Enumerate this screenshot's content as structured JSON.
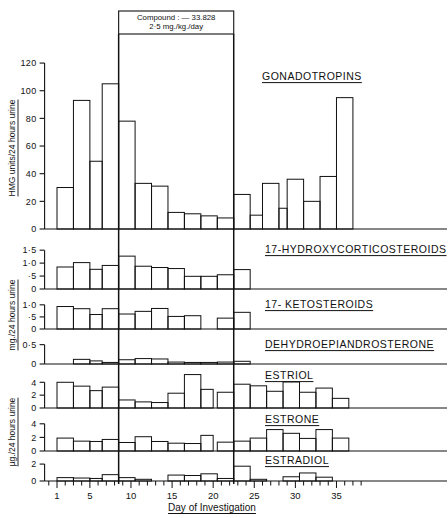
{
  "figure": {
    "treatment_header": {
      "line1": "Compound : — 33.828",
      "line2": "2·5 mg./kg./day",
      "start_day": 8.5,
      "end_day": 22.5
    },
    "x_axis": {
      "title": "Day of Investigation",
      "ticks": [
        1,
        5,
        10,
        15,
        20,
        25,
        30,
        35
      ],
      "min_day": 0,
      "max_day": 38,
      "minor_tick_every": 1
    },
    "axis_titles": {
      "gonadotropins": "HMG units/24 hours urine",
      "steroids_mg": "mg./24 hours urine",
      "estrogens_ug": "µg./24 hours urine"
    }
  },
  "chart_data": [
    {
      "type": "bar",
      "title": "GONADOTROPINS",
      "ylabel": "HMG units/24 hours urine",
      "xlabel": "Day of Investigation",
      "ylim": [
        0,
        128
      ],
      "yticks": [
        0,
        20,
        40,
        60,
        80,
        100,
        120
      ],
      "yticklabels": [
        "0",
        "20",
        "40",
        "60",
        "80",
        "100",
        "120"
      ],
      "grid": false,
      "bars": [
        {
          "x0": 1,
          "x1": 3,
          "value": 30
        },
        {
          "x0": 3,
          "x1": 5,
          "value": 93
        },
        {
          "x0": 5,
          "x1": 6.5,
          "value": 49
        },
        {
          "x0": 6.5,
          "x1": 8.5,
          "value": 105
        },
        {
          "x0": 8.5,
          "x1": 10.5,
          "value": 78
        },
        {
          "x0": 10.5,
          "x1": 12.5,
          "value": 33
        },
        {
          "x0": 12.5,
          "x1": 14.5,
          "value": 31
        },
        {
          "x0": 14.5,
          "x1": 16.5,
          "value": 12
        },
        {
          "x0": 16.5,
          "x1": 18.5,
          "value": 11
        },
        {
          "x0": 18.5,
          "x1": 20.5,
          "value": 9.5
        },
        {
          "x0": 20.5,
          "x1": 22.5,
          "value": 8
        },
        {
          "x0": 22.5,
          "x1": 24.5,
          "value": 25
        },
        {
          "x0": 24.5,
          "x1": 26,
          "value": 10
        },
        {
          "x0": 26,
          "x1": 28,
          "value": 33
        },
        {
          "x0": 28,
          "x1": 29,
          "value": 15
        },
        {
          "x0": 29,
          "x1": 31,
          "value": 36
        },
        {
          "x0": 31,
          "x1": 33,
          "value": 20
        },
        {
          "x0": 33,
          "x1": 35,
          "value": 38
        },
        {
          "x0": 35,
          "x1": 37,
          "value": 95
        }
      ]
    },
    {
      "type": "bar",
      "title": "17-HYDROXYCORTICOSTEROIDS",
      "ylabel": "mg./24 hours urine",
      "ylim": [
        0,
        1.7
      ],
      "yticks": [
        0,
        0.5,
        1.0,
        1.5
      ],
      "yticklabels": [
        "0",
        "·5",
        "1·0",
        "1·5"
      ],
      "grid": false,
      "bars": [
        {
          "x0": 1,
          "x1": 3,
          "value": 0.85
        },
        {
          "x0": 3,
          "x1": 5,
          "value": 1.02
        },
        {
          "x0": 5,
          "x1": 6.5,
          "value": 0.76
        },
        {
          "x0": 6.5,
          "x1": 8.5,
          "value": 0.91
        },
        {
          "x0": 8.5,
          "x1": 10.5,
          "value": 1.27
        },
        {
          "x0": 10.5,
          "x1": 12.5,
          "value": 0.88
        },
        {
          "x0": 12.5,
          "x1": 14.5,
          "value": 0.83
        },
        {
          "x0": 14.5,
          "x1": 16.5,
          "value": 0.79
        },
        {
          "x0": 16.5,
          "x1": 18.5,
          "value": 0.49
        },
        {
          "x0": 18.5,
          "x1": 20.5,
          "value": 0.49
        },
        {
          "x0": 20.5,
          "x1": 22.5,
          "value": 0.55
        },
        {
          "x0": 22.5,
          "x1": 24.5,
          "value": 0.75
        }
      ]
    },
    {
      "type": "bar",
      "title": "17- KETOSTEROIDS",
      "ylabel": "mg./24 hours urine",
      "ylim": [
        0,
        1.2
      ],
      "yticks": [
        0,
        0.5,
        1.0
      ],
      "yticklabels": [
        "0",
        "·5",
        "1·0"
      ],
      "grid": false,
      "bars": [
        {
          "x0": 1,
          "x1": 3,
          "value": 0.93
        },
        {
          "x0": 3,
          "x1": 5,
          "value": 0.84
        },
        {
          "x0": 5,
          "x1": 6.5,
          "value": 0.6
        },
        {
          "x0": 6.5,
          "x1": 8.5,
          "value": 0.84
        },
        {
          "x0": 8.5,
          "x1": 10.5,
          "value": 0.62
        },
        {
          "x0": 10.5,
          "x1": 12.5,
          "value": 0.73
        },
        {
          "x0": 12.5,
          "x1": 14.5,
          "value": 0.85
        },
        {
          "x0": 14.5,
          "x1": 16.5,
          "value": 0.52
        },
        {
          "x0": 16.5,
          "x1": 18.5,
          "value": 0.55
        },
        {
          "x0": 18.5,
          "x1": 20.5,
          "value": 0.0
        },
        {
          "x0": 20.5,
          "x1": 22.5,
          "value": 0.45
        },
        {
          "x0": 22.5,
          "x1": 24.5,
          "value": 0.69
        }
      ]
    },
    {
      "type": "bar",
      "title": "DEHYDROEPIANDROSTERONE",
      "ylabel": "mg./24 hours urine",
      "ylim": [
        0,
        0.62
      ],
      "yticks": [
        0,
        0.5
      ],
      "yticklabels": [
        "0",
        "0·5"
      ],
      "grid": false,
      "bars": [
        {
          "x0": 1,
          "x1": 3,
          "value": 0.0
        },
        {
          "x0": 3,
          "x1": 5,
          "value": 0.12
        },
        {
          "x0": 5,
          "x1": 6.5,
          "value": 0.08
        },
        {
          "x0": 6.5,
          "x1": 8.5,
          "value": 0.04
        },
        {
          "x0": 8.5,
          "x1": 10.5,
          "value": 0.11
        },
        {
          "x0": 10.5,
          "x1": 12.5,
          "value": 0.14
        },
        {
          "x0": 12.5,
          "x1": 14.5,
          "value": 0.13
        },
        {
          "x0": 14.5,
          "x1": 16.5,
          "value": 0.05
        },
        {
          "x0": 16.5,
          "x1": 18.5,
          "value": 0.04
        },
        {
          "x0": 18.5,
          "x1": 20.5,
          "value": 0.04
        },
        {
          "x0": 20.5,
          "x1": 22.5,
          "value": 0.05
        },
        {
          "x0": 22.5,
          "x1": 24.5,
          "value": 0.07
        }
      ]
    },
    {
      "type": "bar",
      "title": "ESTRIOL",
      "ylabel": "µg./24 hours urine",
      "ylim": [
        0,
        5.6
      ],
      "yticks": [
        0,
        2,
        4
      ],
      "yticklabels": [
        "0",
        "2",
        "4"
      ],
      "grid": false,
      "bars": [
        {
          "x0": 1,
          "x1": 3,
          "value": 4.0
        },
        {
          "x0": 3,
          "x1": 5,
          "value": 3.4
        },
        {
          "x0": 5,
          "x1": 6.5,
          "value": 2.7
        },
        {
          "x0": 6.5,
          "x1": 8.5,
          "value": 3.25
        },
        {
          "x0": 8.5,
          "x1": 10.5,
          "value": 1.25
        },
        {
          "x0": 10.5,
          "x1": 12.5,
          "value": 0.95
        },
        {
          "x0": 12.5,
          "x1": 14.5,
          "value": 0.85
        },
        {
          "x0": 14.5,
          "x1": 16.5,
          "value": 2.3
        },
        {
          "x0": 16.5,
          "x1": 18.5,
          "value": 5.2
        },
        {
          "x0": 18.5,
          "x1": 20,
          "value": 2.9
        },
        {
          "x0": 20.5,
          "x1": 22.5,
          "value": 2.45
        },
        {
          "x0": 22.5,
          "x1": 24.5,
          "value": 3.7
        },
        {
          "x0": 24.5,
          "x1": 26.5,
          "value": 3.45
        },
        {
          "x0": 26.5,
          "x1": 28.5,
          "value": 2.6
        },
        {
          "x0": 28.5,
          "x1": 30.5,
          "value": 4.05
        },
        {
          "x0": 30.5,
          "x1": 32.5,
          "value": 2.45
        },
        {
          "x0": 32.5,
          "x1": 34.5,
          "value": 3.1
        },
        {
          "x0": 34.5,
          "x1": 36.5,
          "value": 1.5
        }
      ]
    },
    {
      "type": "bar",
      "title": "ESTRONE",
      "ylabel": "µg./24 hours urine",
      "ylim": [
        0,
        5.0
      ],
      "yticks": [
        0,
        2,
        4
      ],
      "yticklabels": [
        "0",
        "2",
        "4"
      ],
      "grid": false,
      "bars": [
        {
          "x0": 1,
          "x1": 3,
          "value": 1.9
        },
        {
          "x0": 3,
          "x1": 5,
          "value": 1.45
        },
        {
          "x0": 5,
          "x1": 6.5,
          "value": 1.4
        },
        {
          "x0": 6.5,
          "x1": 8.5,
          "value": 1.7
        },
        {
          "x0": 8.5,
          "x1": 10.5,
          "value": 1.25
        },
        {
          "x0": 10.5,
          "x1": 12.5,
          "value": 2.1
        },
        {
          "x0": 12.5,
          "x1": 14.5,
          "value": 1.4
        },
        {
          "x0": 14.5,
          "x1": 16.5,
          "value": 1.15
        },
        {
          "x0": 16.5,
          "x1": 18.5,
          "value": 1.1
        },
        {
          "x0": 18.5,
          "x1": 20,
          "value": 2.3
        },
        {
          "x0": 20.5,
          "x1": 22.5,
          "value": 1.3
        },
        {
          "x0": 22.5,
          "x1": 24.5,
          "value": 1.45
        },
        {
          "x0": 24.5,
          "x1": 26.5,
          "value": 1.9
        },
        {
          "x0": 26.5,
          "x1": 28.5,
          "value": 3.15
        },
        {
          "x0": 28.5,
          "x1": 30.5,
          "value": 2.6
        },
        {
          "x0": 30.5,
          "x1": 32.5,
          "value": 1.85
        },
        {
          "x0": 32.5,
          "x1": 34.5,
          "value": 3.15
        },
        {
          "x0": 34.5,
          "x1": 36.5,
          "value": 1.9
        }
      ]
    },
    {
      "type": "bar",
      "title": "ESTRADIOL",
      "ylabel": "µg./24 hours urine",
      "ylim": [
        0,
        2.6
      ],
      "yticks": [
        0,
        2
      ],
      "yticklabels": [
        "0",
        "2"
      ],
      "grid": false,
      "bars": [
        {
          "x0": 1,
          "x1": 3,
          "value": 0.4
        },
        {
          "x0": 3,
          "x1": 5,
          "value": 0.35
        },
        {
          "x0": 5,
          "x1": 6.5,
          "value": 0.3
        },
        {
          "x0": 6.5,
          "x1": 8.5,
          "value": 0.75
        },
        {
          "x0": 8.5,
          "x1": 10.5,
          "value": 0.4
        },
        {
          "x0": 10.5,
          "x1": 12.5,
          "value": 0.2
        },
        {
          "x0": 12.5,
          "x1": 14.5,
          "value": 0.0
        },
        {
          "x0": 14.5,
          "x1": 16.5,
          "value": 0.7
        },
        {
          "x0": 16.5,
          "x1": 18.5,
          "value": 0.65
        },
        {
          "x0": 18.5,
          "x1": 20.5,
          "value": 0.85
        },
        {
          "x0": 20.5,
          "x1": 22.5,
          "value": 0.3
        },
        {
          "x0": 22.5,
          "x1": 24.5,
          "value": 1.75
        },
        {
          "x0": 24.5,
          "x1": 26.5,
          "value": 0.2
        },
        {
          "x0": 26.5,
          "x1": 28.5,
          "value": 0.0
        },
        {
          "x0": 28.5,
          "x1": 30.5,
          "value": 0.5
        },
        {
          "x0": 30.5,
          "x1": 32.5,
          "value": 0.95
        },
        {
          "x0": 32.5,
          "x1": 34.5,
          "value": 0.45
        },
        {
          "x0": 34.5,
          "x1": 36.5,
          "value": 0.0
        }
      ]
    }
  ]
}
